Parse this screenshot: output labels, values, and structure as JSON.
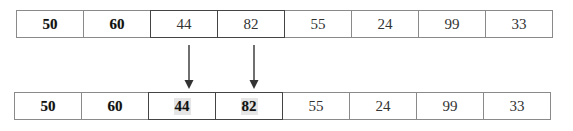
{
  "diagram": {
    "top_array": {
      "cells": [
        {
          "value": "50",
          "strong": true,
          "highlighted": false
        },
        {
          "value": "60",
          "strong": true,
          "highlighted": false
        },
        {
          "value": "44",
          "strong": false,
          "highlighted": true
        },
        {
          "value": "82",
          "strong": false,
          "highlighted": true
        },
        {
          "value": "55",
          "strong": false,
          "highlighted": false
        },
        {
          "value": "24",
          "strong": false,
          "highlighted": false
        },
        {
          "value": "99",
          "strong": false,
          "highlighted": false
        },
        {
          "value": "33",
          "strong": false,
          "highlighted": false
        }
      ]
    },
    "bottom_array": {
      "cells": [
        {
          "value": "50",
          "strong": true,
          "highlighted": false
        },
        {
          "value": "60",
          "strong": true,
          "highlighted": false
        },
        {
          "value": "44",
          "strong": true,
          "highlighted": true
        },
        {
          "value": "82",
          "strong": true,
          "highlighted": true
        },
        {
          "value": "55",
          "strong": false,
          "highlighted": false
        },
        {
          "value": "24",
          "strong": false,
          "highlighted": false
        },
        {
          "value": "99",
          "strong": false,
          "highlighted": false
        },
        {
          "value": "33",
          "strong": false,
          "highlighted": false
        }
      ]
    },
    "arrows": [
      {
        "from_index": 2,
        "to_index": 2
      },
      {
        "from_index": 3,
        "to_index": 3
      }
    ],
    "colors": {
      "border": "#8a8a8a",
      "highlight_border": "#444444",
      "arrow": "#333333",
      "text": "#333333"
    }
  }
}
